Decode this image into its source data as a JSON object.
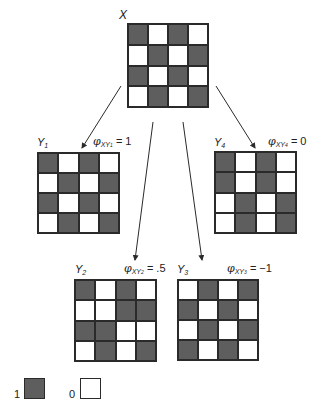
{
  "figure": {
    "x": {
      "label": "X",
      "cells": [
        [
          1,
          0,
          1,
          0
        ],
        [
          0,
          1,
          0,
          1
        ],
        [
          1,
          0,
          1,
          0
        ],
        [
          0,
          1,
          0,
          1
        ]
      ]
    },
    "panels": [
      {
        "id": "y1",
        "var": "Y",
        "var_sub": "1",
        "phi_symbol": "φ",
        "phi_sub": "XY",
        "phi_sub_index": "1",
        "phi_value": " = 1",
        "cells": [
          [
            1,
            0,
            1,
            0
          ],
          [
            0,
            1,
            0,
            1
          ],
          [
            1,
            0,
            1,
            0
          ],
          [
            0,
            1,
            0,
            1
          ]
        ]
      },
      {
        "id": "y4",
        "var": "Y",
        "var_sub": "4",
        "phi_symbol": "φ",
        "phi_sub": "XY",
        "phi_sub_index": "4",
        "phi_value": " = 0",
        "cells": [
          [
            1,
            0,
            1,
            0
          ],
          [
            1,
            0,
            1,
            0
          ],
          [
            0,
            1,
            0,
            1
          ],
          [
            0,
            1,
            0,
            1
          ]
        ]
      },
      {
        "id": "y2",
        "var": "Y",
        "var_sub": "2",
        "phi_symbol": "φ",
        "phi_sub": "XY",
        "phi_sub_index": "2",
        "phi_value": " = .5",
        "cells": [
          [
            1,
            0,
            1,
            0
          ],
          [
            0,
            0,
            1,
            1
          ],
          [
            1,
            1,
            0,
            0
          ],
          [
            0,
            1,
            0,
            1
          ]
        ]
      },
      {
        "id": "y3",
        "var": "Y",
        "var_sub": "3",
        "phi_symbol": "φ",
        "phi_sub": "XY",
        "phi_sub_index": "3",
        "phi_value": " = −1",
        "cells": [
          [
            0,
            1,
            0,
            1
          ],
          [
            1,
            0,
            1,
            0
          ],
          [
            0,
            1,
            0,
            1
          ],
          [
            1,
            0,
            1,
            0
          ]
        ]
      }
    ],
    "legend": [
      {
        "value": "1",
        "state": "filled"
      },
      {
        "value": "0",
        "state": "empty"
      }
    ],
    "colors": {
      "filled": "#5e5e5e",
      "empty": "#ffffff",
      "border": "#2a2a2a"
    }
  }
}
